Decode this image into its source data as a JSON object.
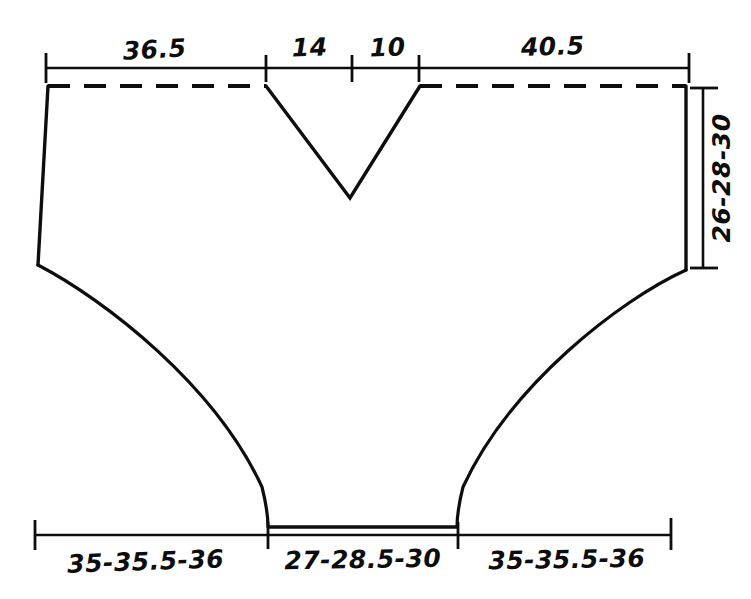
{
  "diagram": {
    "type": "garment-pattern-schematic",
    "title": "",
    "line_color": "#0d0d0d",
    "background_color": "#ffffff",
    "top_dimensions": [
      {
        "label": "36.5",
        "x_start": 45,
        "x_end": 266
      },
      {
        "label": "14",
        "x_start": 266,
        "x_end": 352
      },
      {
        "label": "10",
        "x_start": 352,
        "x_end": 419
      },
      {
        "label": "40.5",
        "x_start": 419,
        "x_end": 690
      }
    ],
    "bottom_dimensions": [
      {
        "label": "35-35.5-36",
        "x_start": 34,
        "x_end": 268
      },
      {
        "label": "27-28.5-30",
        "x_start": 268,
        "x_end": 458
      },
      {
        "label": "35-35.5-36",
        "x_start": 458,
        "x_end": 672
      }
    ],
    "side_dimension": {
      "label": "26-28-30",
      "y_start": 88,
      "y_end": 268,
      "x": 703,
      "orientation": "vertical-rotated"
    },
    "top_ruler": {
      "y": 68,
      "x_start": 45,
      "x_end": 690,
      "ticks": [
        45,
        266,
        352,
        419,
        690
      ]
    },
    "bottom_ruler": {
      "y": 535,
      "x_start": 34,
      "x_end": 672,
      "ticks": [
        34,
        268,
        458,
        672
      ]
    },
    "outline": {
      "top_dashed_left": {
        "x_start": 48,
        "x_end": 266,
        "y": 86
      },
      "top_dashed_right": {
        "x_start": 420,
        "x_end": 686,
        "y": 86
      },
      "neckline_v": {
        "left_x": 266,
        "apex_x": 350,
        "apex_y": 198,
        "right_x": 420,
        "top_y": 86
      },
      "left_side": {
        "x_top": 48,
        "y_top": 86,
        "x_bottom": 38,
        "y_bottom": 265
      },
      "right_side": {
        "x_top": 686,
        "y_top": 86,
        "x_bottom": 686,
        "y_bottom": 270
      },
      "left_curve": {
        "from_x": 38,
        "from_y": 265,
        "to_x": 268,
        "to_y": 527
      },
      "right_curve": {
        "from_x": 457,
        "from_y": 527,
        "to_x": 686,
        "to_y": 270
      },
      "crotch_line": {
        "x_start": 268,
        "x_end": 457,
        "y": 527
      }
    }
  }
}
